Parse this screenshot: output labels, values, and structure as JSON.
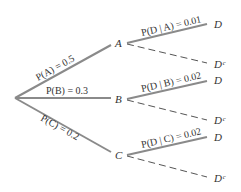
{
  "diagram": {
    "type": "probability-tree",
    "colors": {
      "branch": "#8a8a8a",
      "text": "#333333"
    },
    "root": {
      "x": 15,
      "y": 98
    },
    "nodes": [
      {
        "id": "A",
        "label": "A",
        "x": 118,
        "y": 43
      },
      {
        "id": "B",
        "label": "B",
        "x": 118,
        "y": 99
      },
      {
        "id": "C",
        "label": "C",
        "x": 118,
        "y": 155
      }
    ],
    "first_level_labels": {
      "A": "P(A) = 0.5",
      "B": "P(B) = 0.3",
      "C": "P(C) = 0.2"
    },
    "second_level_labels": {
      "A": "P(D | A) = 0.01",
      "B": "P(D | B) = 0.02",
      "C": "P(D | C) = 0.02"
    },
    "leaves": {
      "A_D": "D",
      "A_Dc": "Dᶜ",
      "B_D": "D",
      "B_Dc": "Dᶜ",
      "C_D": "D",
      "C_Dc": "Dᶜ"
    }
  }
}
